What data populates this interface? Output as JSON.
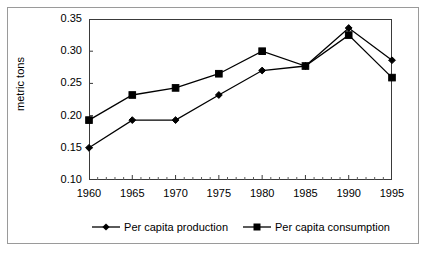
{
  "chart_data": {
    "type": "line",
    "title": "",
    "xlabel": "",
    "ylabel": "metric tons",
    "x": [
      1960,
      1965,
      1970,
      1975,
      1980,
      1985,
      1990,
      1995
    ],
    "xtick_labels": [
      "1960",
      "1965",
      "1970",
      "1975",
      "1980",
      "1985",
      "1990",
      "1995"
    ],
    "ytick_labels": [
      "0.10",
      "0.15",
      "0.20",
      "0.25",
      "0.30",
      "0.35"
    ],
    "ytick_values": [
      0.1,
      0.15,
      0.2,
      0.25,
      0.3,
      0.35
    ],
    "ylim": [
      0.1,
      0.35
    ],
    "xlim": [
      1960,
      1995
    ],
    "grid": false,
    "minor_xticks": true,
    "legend_position": "bottom",
    "series": [
      {
        "name": "Per capita production",
        "marker": "diamond",
        "color": "#000000",
        "values": [
          0.15,
          0.193,
          0.193,
          0.232,
          0.27,
          0.277,
          0.336,
          0.286
        ]
      },
      {
        "name": "Per capita consumption",
        "marker": "square",
        "color": "#000000",
        "values": [
          0.193,
          0.232,
          0.243,
          0.265,
          0.3,
          0.277,
          0.325,
          0.259
        ]
      }
    ]
  },
  "legend": {
    "items": [
      {
        "label": "Per capita production",
        "marker": "diamond"
      },
      {
        "label": "Per capita consumption",
        "marker": "square"
      }
    ]
  },
  "axes": {
    "y_title": "metric tons"
  }
}
